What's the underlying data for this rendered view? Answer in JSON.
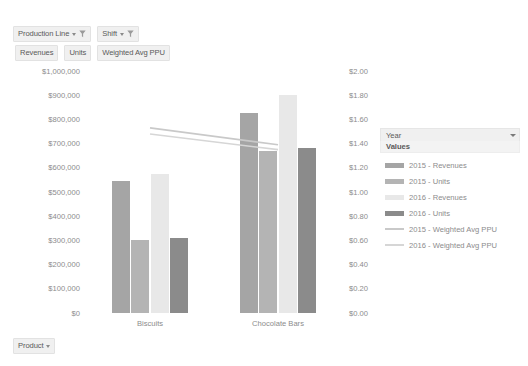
{
  "pivot_buttons": {
    "filters": [
      {
        "label": "Production Line",
        "icon": "filter-funnel-icon"
      },
      {
        "label": "Shift",
        "icon": "filter-funnel-icon"
      }
    ],
    "values": [
      {
        "label": "Revenues"
      },
      {
        "label": "Units"
      },
      {
        "label": "Weighted Avg PPU"
      }
    ],
    "axis": {
      "label": "Product"
    }
  },
  "legend": {
    "header_label": "Year",
    "subheader_label": "Values",
    "items": [
      {
        "label": "2015 - Revenues",
        "color": "#a5a5a5",
        "kind": "bar"
      },
      {
        "label": "2015 - Units",
        "color": "#b4b4b4",
        "kind": "bar"
      },
      {
        "label": "2016 - Revenues",
        "color": "#e8e8e8",
        "kind": "bar"
      },
      {
        "label": "2016 - Units",
        "color": "#8b8b8b",
        "kind": "bar"
      },
      {
        "label": "2015 - Weighted Avg PPU",
        "color": "#c9c9c9",
        "kind": "line"
      },
      {
        "label": "2016 - Weighted Avg PPU",
        "color": "#d6d6d6",
        "kind": "line"
      }
    ]
  },
  "chart_data": {
    "type": "bar",
    "title": "",
    "xlabel": "",
    "ylabel": "",
    "grid": false,
    "legend_position": "right",
    "categories": [
      "Biscuits",
      "Chocolate Bars"
    ],
    "left_axis": {
      "label": "",
      "ylim": [
        0,
        1000000
      ],
      "tick_values": [
        0,
        100000,
        200000,
        300000,
        400000,
        500000,
        600000,
        700000,
        800000,
        900000,
        1000000
      ],
      "tick_labels": [
        "$0",
        "$100,000",
        "$200,000",
        "$300,000",
        "$400,000",
        "$500,000",
        "$600,000",
        "$700,000",
        "$800,000",
        "$900,000",
        "$1,000,000"
      ]
    },
    "right_axis": {
      "label": "",
      "ylim": [
        0,
        2.0
      ],
      "tick_values": [
        0,
        0.2,
        0.4,
        0.6,
        0.8,
        1.0,
        1.2,
        1.4,
        1.6,
        1.8,
        2.0
      ],
      "tick_labels": [
        "$0.00",
        "$0.20",
        "$0.40",
        "$0.60",
        "$0.80",
        "$1.00",
        "$1.20",
        "$1.40",
        "$1.60",
        "$1.80",
        "$2.00"
      ]
    },
    "bar_series": [
      {
        "name": "2015 - Revenues",
        "axis": "left",
        "color": "#a5a5a5",
        "values": [
          545000,
          825000
        ]
      },
      {
        "name": "2015 - Units",
        "axis": "left",
        "color": "#b4b4b4",
        "values": [
          300000,
          670000
        ]
      },
      {
        "name": "2016 - Revenues",
        "axis": "left",
        "color": "#e8e8e8",
        "values": [
          575000,
          900000
        ]
      },
      {
        "name": "2016 - Units",
        "axis": "left",
        "color": "#8b8b8b",
        "values": [
          310000,
          680000
        ]
      }
    ],
    "line_series": [
      {
        "name": "2015 - Weighted Avg PPU",
        "axis": "right",
        "color": "#c9c9c9",
        "values": [
          1.53,
          1.39
        ]
      },
      {
        "name": "2016 - Weighted Avg PPU",
        "axis": "right",
        "color": "#d6d6d6",
        "values": [
          1.48,
          1.35
        ]
      }
    ]
  }
}
